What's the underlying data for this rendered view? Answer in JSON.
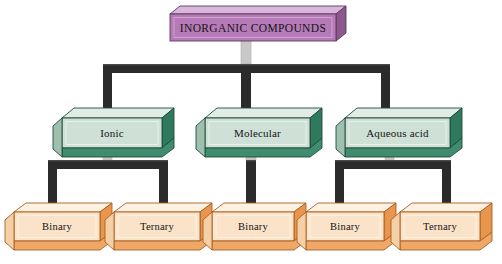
{
  "diagram": {
    "title_text": "INORGANIC COMPOUNDS",
    "type": "hierarchy-tree",
    "background_color": "#ffffff",
    "levels": 3,
    "colors": {
      "root_face": "#b77ab8",
      "root_top": "#d9b6da",
      "root_side": "#8e5790",
      "root_outline": "#5a3a5c",
      "branch_face": "#cfe0d6",
      "branch_side": "#2f7a5e",
      "branch_bottom": "#3f8d6e",
      "branch_outline": "#1f4a3a",
      "leaf_face": "#fae3c8",
      "leaf_side": "#e8954e",
      "leaf_bottom": "#f0a868",
      "leaf_outline": "#a8601f",
      "connector": "#2b2b2b",
      "stub": "#c8c8c8"
    },
    "root": {
      "label": "INORGANIC COMPOUNDS",
      "name": "node-inorganic-compounds"
    },
    "branches": [
      {
        "label": "Ionic",
        "name": "node-ionic"
      },
      {
        "label": "Molecular",
        "name": "node-molecular"
      },
      {
        "label": "Aqueous acid",
        "name": "node-aqueous-acid"
      }
    ],
    "leaves": [
      {
        "label": "Binary",
        "name": "node-ionic-binary",
        "parent": "Ionic"
      },
      {
        "label": "Ternary",
        "name": "node-ionic-ternary",
        "parent": "Ionic"
      },
      {
        "label": "Binary",
        "name": "node-molecular-binary",
        "parent": "Molecular"
      },
      {
        "label": "Binary",
        "name": "node-aqueous-binary",
        "parent": "Aqueous acid"
      },
      {
        "label": "Ternary",
        "name": "node-aqueous-ternary",
        "parent": "Aqueous acid"
      }
    ]
  }
}
